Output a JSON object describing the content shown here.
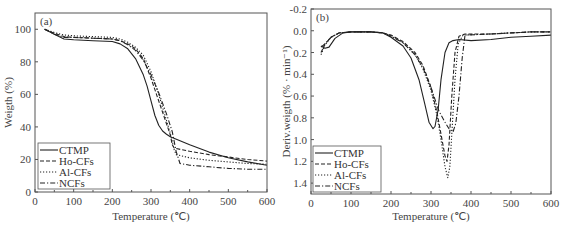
{
  "figure": {
    "panels": [
      {
        "id": "a",
        "panel_label": "(a)",
        "xlabel": "Temperature (℃)",
        "ylabel": "Weigth (%)",
        "xticks": [
          "0",
          "100",
          "200",
          "300",
          "400",
          "500",
          "600"
        ],
        "yticks": [
          "0",
          "20",
          "40",
          "60",
          "80",
          "100"
        ]
      },
      {
        "id": "b",
        "panel_label": "(b)",
        "xlabel": "Temperature (℃)",
        "ylabel": "Deriv.weigth (% · min⁻¹)",
        "xticks": [
          "0",
          "100",
          "200",
          "300",
          "400",
          "500",
          "600"
        ],
        "yticks": [
          "-0.2",
          "0.0",
          "0.2",
          "0.4",
          "0.6",
          "0.8",
          "1.0",
          "1.2",
          "1.4"
        ]
      }
    ],
    "legend": [
      "CTMP",
      "Ho-CFs",
      "Al-CFs",
      "NCFs"
    ]
  },
  "chart_data": [
    {
      "type": "line",
      "title": "(a)",
      "xlabel": "Temperature (℃)",
      "ylabel": "Weigth (%)",
      "xlim": [
        0,
        600
      ],
      "ylim": [
        0,
        110
      ],
      "grid": false,
      "legend_position": "lower left",
      "series": [
        {
          "name": "CTMP",
          "style": "solid",
          "x": [
            25,
            50,
            75,
            100,
            150,
            200,
            220,
            240,
            260,
            280,
            290,
            300,
            310,
            320,
            330,
            340,
            350,
            400,
            450,
            500,
            550,
            600
          ],
          "y": [
            100,
            97,
            94,
            93.5,
            93,
            92.5,
            91,
            88,
            82,
            72,
            65,
            56,
            47,
            41,
            37.5,
            35.5,
            34,
            29,
            24.5,
            21,
            18.5,
            16.5
          ]
        },
        {
          "name": "Ho-CFs",
          "style": "dashed",
          "x": [
            25,
            50,
            75,
            100,
            150,
            200,
            220,
            240,
            260,
            280,
            300,
            320,
            330,
            340,
            350,
            355,
            360,
            400,
            450,
            500,
            550,
            600
          ],
          "y": [
            100,
            97.5,
            95.5,
            95,
            94.5,
            94,
            93,
            91,
            88,
            82,
            70,
            56,
            49,
            42,
            35,
            29,
            27,
            25,
            23,
            21.5,
            20,
            19
          ]
        },
        {
          "name": "Al-CFs",
          "style": "dotted",
          "x": [
            25,
            50,
            75,
            100,
            150,
            200,
            220,
            240,
            260,
            280,
            300,
            320,
            340,
            350,
            360,
            365,
            400,
            450,
            500,
            550,
            600
          ],
          "y": [
            100,
            98,
            96.5,
            96,
            95.5,
            95,
            94,
            92,
            89,
            84,
            74,
            60,
            44,
            36,
            26,
            23,
            21,
            19.5,
            18.5,
            17.5,
            17
          ]
        },
        {
          "name": "NCFs",
          "style": "dashdot",
          "x": [
            25,
            50,
            75,
            100,
            150,
            200,
            220,
            240,
            260,
            280,
            300,
            320,
            340,
            355,
            365,
            375,
            400,
            450,
            500,
            550,
            600
          ],
          "y": [
            100,
            97,
            95,
            95,
            94.5,
            94,
            93,
            90.5,
            87,
            81,
            72,
            61,
            48,
            37,
            25,
            17.5,
            16.5,
            15.5,
            14.5,
            14,
            14
          ]
        }
      ]
    },
    {
      "type": "line",
      "title": "(b)",
      "xlabel": "Temperature (℃)",
      "ylabel": "Deriv.weigth (% · min⁻¹)",
      "xlim": [
        0,
        600
      ],
      "ylim": [
        -0.2,
        1.5
      ],
      "y_inverted": true,
      "grid": false,
      "legend_position": "lower left",
      "series": [
        {
          "name": "CTMP",
          "style": "solid",
          "x": [
            25,
            35,
            45,
            60,
            80,
            100,
            150,
            180,
            200,
            230,
            250,
            270,
            285,
            295,
            305,
            310,
            318,
            325,
            335,
            345,
            355,
            370,
            400,
            450,
            500,
            550,
            600
          ],
          "y": [
            0.14,
            0.16,
            0.15,
            0.07,
            0.02,
            0.01,
            0.01,
            0.02,
            0.06,
            0.14,
            0.25,
            0.45,
            0.68,
            0.84,
            0.9,
            0.88,
            0.72,
            0.45,
            0.2,
            0.11,
            0.09,
            0.08,
            0.09,
            0.08,
            0.06,
            0.05,
            0.04
          ]
        },
        {
          "name": "Ho-CFs",
          "style": "dashed",
          "x": [
            25,
            35,
            50,
            70,
            100,
            150,
            180,
            200,
            230,
            260,
            280,
            300,
            315,
            325,
            335,
            340,
            345,
            352,
            360,
            370,
            385,
            450,
            500,
            550,
            600
          ],
          "y": [
            0.2,
            0.12,
            0.06,
            0.02,
            0.01,
            0.01,
            0.02,
            0.04,
            0.1,
            0.2,
            0.32,
            0.52,
            0.75,
            0.95,
            1.15,
            1.2,
            1.05,
            0.6,
            0.2,
            0.05,
            0.03,
            0.03,
            0.02,
            0.01,
            0.01
          ]
        },
        {
          "name": "Al-CFs",
          "style": "dotted",
          "x": [
            25,
            35,
            50,
            70,
            100,
            150,
            180,
            200,
            230,
            260,
            280,
            300,
            315,
            325,
            335,
            342,
            347,
            352,
            360,
            368,
            380,
            450,
            500,
            550,
            600
          ],
          "y": [
            0.22,
            0.13,
            0.06,
            0.02,
            0.01,
            0.01,
            0.02,
            0.05,
            0.11,
            0.22,
            0.35,
            0.55,
            0.78,
            1.0,
            1.25,
            1.35,
            1.25,
            0.95,
            0.45,
            0.12,
            0.04,
            0.03,
            0.02,
            0.01,
            0.01
          ]
        },
        {
          "name": "NCFs",
          "style": "dashdot",
          "x": [
            25,
            35,
            50,
            70,
            100,
            150,
            180,
            200,
            230,
            260,
            280,
            300,
            320,
            335,
            345,
            355,
            362,
            370,
            378,
            385,
            450,
            500,
            550,
            600
          ],
          "y": [
            0.15,
            0.12,
            0.06,
            0.02,
            0.01,
            0.01,
            0.02,
            0.05,
            0.11,
            0.22,
            0.34,
            0.52,
            0.74,
            0.84,
            0.9,
            0.93,
            0.85,
            0.6,
            0.25,
            0.04,
            0.03,
            0.02,
            0.01,
            0.01
          ]
        }
      ]
    }
  ]
}
